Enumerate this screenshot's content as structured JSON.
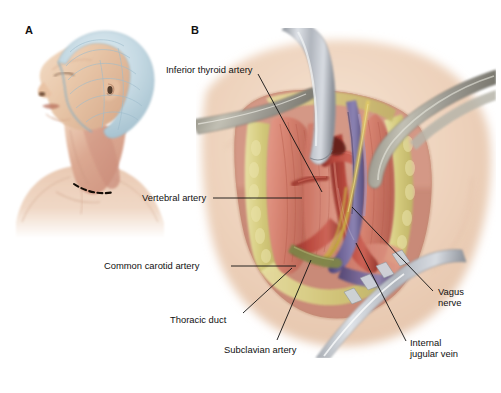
{
  "figure": {
    "width": 501,
    "height": 393,
    "background": "#ffffff",
    "type": "medical-illustration"
  },
  "panels": [
    {
      "id": "A",
      "letter": "A",
      "name": "patient-positioning",
      "caption": "",
      "elements": [
        {
          "name": "surgical-cap",
          "label": "surgical cap",
          "color": "#b9d2dd"
        },
        {
          "name": "patient-head",
          "label": "patient head",
          "color": "#e7c6ab"
        },
        {
          "name": "patient-neck",
          "label": "neck",
          "color": "#dfae99"
        },
        {
          "name": "incision-line",
          "label": "planned incision",
          "color": "#1a1008"
        }
      ]
    },
    {
      "id": "B",
      "letter": "B",
      "name": "surgical-exposure",
      "caption": "",
      "elements": [
        {
          "name": "skin",
          "label": "skin",
          "color": "#e8cbb4"
        },
        {
          "name": "subcutaneous-fat",
          "label": "subcutaneous fat",
          "color": "#d8cf86"
        },
        {
          "name": "muscle",
          "label": "muscle",
          "color": "#d88273"
        },
        {
          "name": "artery",
          "label": "artery",
          "color": "#b2453c"
        },
        {
          "name": "vein",
          "label": "vein",
          "color": "#6c6095"
        },
        {
          "name": "nerve",
          "label": "nerve",
          "color": "#d2b449"
        },
        {
          "name": "retractor",
          "label": "retractor",
          "color": "#b9bcc2"
        },
        {
          "name": "forceps",
          "label": "forceps",
          "color": "#a9a79a"
        }
      ]
    }
  ],
  "labels": [
    {
      "id": "inferior-thyroid-artery",
      "text": "Inferior thyroid artery",
      "x": 166,
      "y": 64,
      "align": "left",
      "leader": {
        "type": "diagonal",
        "x1": 258,
        "y1": 74,
        "x2": 322,
        "y2": 192
      }
    },
    {
      "id": "vertebral-artery",
      "text": "Vertebral artery",
      "x": 142,
      "y": 193,
      "align": "left",
      "leader": {
        "type": "horizontal",
        "x1": 213,
        "y1": 198,
        "x2": 302,
        "y2": 198
      }
    },
    {
      "id": "common-carotid-artery",
      "text": "Common carotid artery",
      "x": 104,
      "y": 261,
      "align": "left",
      "leader": {
        "type": "horizontal",
        "x1": 231,
        "y1": 266,
        "x2": 296,
        "y2": 266
      }
    },
    {
      "id": "thoracic-duct",
      "text": "Thoracic duct",
      "x": 170,
      "y": 315,
      "align": "left",
      "leader": {
        "type": "diagonal",
        "x1": 243,
        "y1": 313,
        "x2": 290,
        "y2": 270
      }
    },
    {
      "id": "subclavian-artery",
      "text": "Subclavian artery",
      "x": 224,
      "y": 345,
      "align": "left",
      "leader": {
        "type": "diagonal",
        "x1": 276,
        "y1": 340,
        "x2": 310,
        "y2": 262
      }
    },
    {
      "id": "vagus-nerve",
      "text": "Vagus\nnerve",
      "line1": "Vagus",
      "line2": "nerve",
      "x": 438,
      "y": 290,
      "align": "left",
      "leader": {
        "type": "diagonal",
        "x1": 433,
        "y1": 291,
        "x2": 352,
        "y2": 207
      }
    },
    {
      "id": "internal-jugular-vein",
      "text": "Internal\njugular vein",
      "line1": "Internal",
      "line2": "jugular vein",
      "x": 410,
      "y": 342,
      "align": "left",
      "leader": {
        "type": "diagonal",
        "x1": 406,
        "y1": 341,
        "x2": 356,
        "y2": 244
      }
    }
  ],
  "colors": {
    "label_text": "#111111",
    "leader_line": "#111111",
    "artery": "#b2453c",
    "vein": "#6c6095",
    "nerve": "#d2b449",
    "muscle": "#d88273",
    "fat": "#d8cf86",
    "skin": "#e8cbb4",
    "metal": "#b9bcc2",
    "cap": "#b9d2dd"
  }
}
